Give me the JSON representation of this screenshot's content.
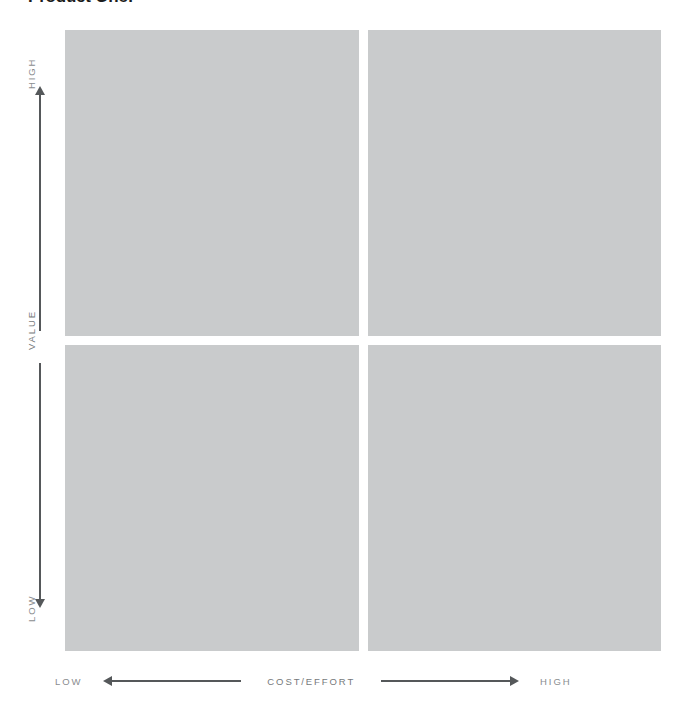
{
  "header": {
    "title": "Product One:"
  },
  "matrix": {
    "type": "2x2-prioritization-matrix",
    "quadrants": [
      {
        "position": "top-left",
        "label": "",
        "value": "high",
        "cost": "low",
        "fill_color": "#c9cbcc"
      },
      {
        "position": "top-right",
        "label": "",
        "value": "high",
        "cost": "high",
        "fill_color": "#c9cbcc"
      },
      {
        "position": "bottom-left",
        "label": "",
        "value": "low",
        "cost": "low",
        "fill_color": "#c9cbcc"
      },
      {
        "position": "bottom-right",
        "label": "",
        "value": "low",
        "cost": "high",
        "fill_color": "#c9cbcc"
      }
    ]
  },
  "axes": {
    "vertical": {
      "name": "VALUE",
      "high_label": "HIGH",
      "low_label": "LOW",
      "arrow_color": "#55585a",
      "text_color": "#8a8d8f"
    },
    "horizontal": {
      "name": "COST/EFFORT",
      "low_label": "LOW",
      "high_label": "HIGH",
      "arrow_color": "#55585a",
      "text_color": "#8a8d8f"
    }
  }
}
